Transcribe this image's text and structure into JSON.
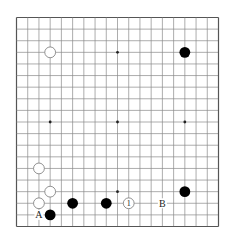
{
  "diagram": {
    "type": "go-board",
    "size": 19,
    "colors": {
      "background": "#ffffff",
      "grid": "#8a8a8a",
      "border": "#555555",
      "black_stone": "#000000",
      "white_stone_fill": "#ffffff",
      "white_stone_stroke": "#777777",
      "label": "#222222"
    },
    "star_points": [
      [
        3,
        3
      ],
      [
        9,
        3
      ],
      [
        15,
        3
      ],
      [
        3,
        9
      ],
      [
        9,
        9
      ],
      [
        15,
        9
      ],
      [
        3,
        15
      ],
      [
        9,
        15
      ],
      [
        15,
        15
      ]
    ],
    "stones": [
      {
        "color": "white",
        "col": 3,
        "row": 3
      },
      {
        "color": "black",
        "col": 15,
        "row": 3
      },
      {
        "color": "white",
        "col": 2,
        "row": 13
      },
      {
        "color": "white",
        "col": 3,
        "row": 15
      },
      {
        "color": "white",
        "col": 2,
        "row": 16
      },
      {
        "color": "black",
        "col": 3,
        "row": 17
      },
      {
        "color": "black",
        "col": 5,
        "row": 16
      },
      {
        "color": "black",
        "col": 8,
        "row": 16
      },
      {
        "color": "white",
        "col": 10,
        "row": 16,
        "number": "1"
      },
      {
        "color": "black",
        "col": 15,
        "row": 15
      }
    ],
    "labels": [
      {
        "text": "A",
        "col": 2,
        "row": 17
      },
      {
        "text": "B",
        "col": 13,
        "row": 16
      }
    ]
  }
}
